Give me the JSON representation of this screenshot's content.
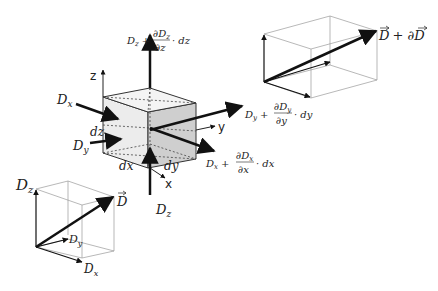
{
  "diagram": {
    "central_cube": {
      "axes": {
        "x": "x",
        "y": "y",
        "z": "z"
      },
      "dimensions": {
        "dx": "dx",
        "dy": "dy",
        "dz": "dz"
      },
      "fluxes_in": {
        "Dx": "D",
        "Dx_sub": "x",
        "Dy": "D",
        "Dy_sub": "y",
        "Dz": "D",
        "Dz_sub": "z"
      },
      "fluxes_out": {
        "z": {
          "base": "D",
          "sub": "z",
          "plus": "+",
          "num": "∂D",
          "num_sub": "z",
          "den": "∂z",
          "tail": "· dz"
        },
        "y": {
          "base": "D",
          "sub": "y",
          "plus": "+",
          "num": "∂D",
          "num_sub": "y",
          "den": "∂y",
          "tail": "· dy"
        },
        "x": {
          "base": "D",
          "sub": "x",
          "plus": "+",
          "num": "∂D",
          "num_sub": "x",
          "den": "∂x",
          "tail": "· dx"
        }
      }
    },
    "top_right_box": {
      "label": "D + ∂D",
      "vec1": "D",
      "plus": "+ ∂",
      "vec2": "D"
    },
    "bottom_left_box": {
      "vector": "D",
      "Dz": "D",
      "Dz_sub": "z",
      "Dy": "D",
      "Dy_sub": "y",
      "Dx": "D",
      "Dx_sub": "x"
    }
  }
}
